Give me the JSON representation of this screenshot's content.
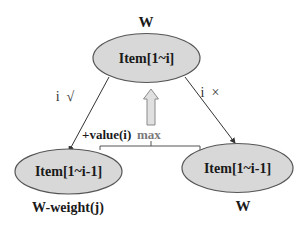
{
  "diagram": {
    "type": "knapsack-recursion-tree",
    "colors": {
      "node_fill": "#d8d8d8",
      "node_stroke": "#555555",
      "edge": "#333333",
      "arrow_fill": "#e0e0e0",
      "arrow_stroke": "#8a8a8a",
      "max_text": "#7a7a7a",
      "bracket": "#555555"
    },
    "root": {
      "label": "Item[1~i]",
      "capacity_label": "W"
    },
    "left_child": {
      "label": "Item[1~i-1]",
      "capacity_label": "W-weight(j)",
      "edge_label": "i  √"
    },
    "right_child": {
      "label": "Item[1~i-1]",
      "capacity_label": "W",
      "edge_label": "i  ×"
    },
    "combine": {
      "value_label": "+value(i)",
      "op_label": "max"
    }
  }
}
